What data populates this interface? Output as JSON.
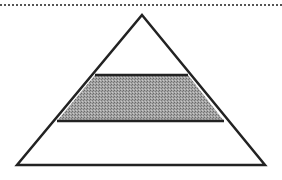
{
  "diagram": {
    "type": "pyramid",
    "levels": [
      {
        "name": "top",
        "fill": "#ffffff"
      },
      {
        "name": "middle",
        "fill": "#9a9a9a",
        "pattern": "stipple"
      },
      {
        "name": "bottom",
        "fill": "#ffffff"
      }
    ],
    "stroke_color": "#222222",
    "separator": "dotted-line"
  }
}
